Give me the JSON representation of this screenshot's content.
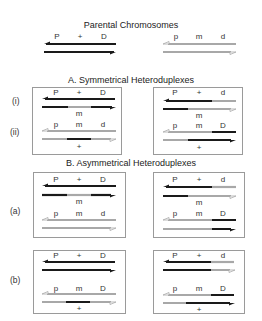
{
  "titles": {
    "parental": "Parental Chromosomes",
    "symmetrical": "A. Symmetrical Heteroduplexes",
    "asymmetrical": "B. Asymmetrical Heteroduplexes"
  },
  "row_labels": {
    "i": "(i)",
    "ii": "(ii)",
    "a": "(a)",
    "b": "(b)"
  },
  "colors": {
    "dark_strand": "#1a1a1a",
    "light_strand": "#a8a8a8",
    "box_border": "#9a9a9a"
  },
  "parental": {
    "left": {
      "markers": [
        "P",
        "+",
        "D"
      ],
      "strands": [
        "dark",
        "dark"
      ]
    },
    "right": {
      "markers": [
        "p",
        "m",
        "d"
      ],
      "strands": [
        "light",
        "light"
      ]
    }
  },
  "symmetrical": {
    "left": {
      "top_pair": {
        "markers_above": [
          "P",
          "+",
          "D"
        ],
        "marker_below": "m",
        "strand1": "dark",
        "strand2": "dark-light-dark"
      },
      "bottom_pair": {
        "markers_above": [
          "p",
          "m",
          "d"
        ],
        "marker_below": "+",
        "strand1": "light",
        "strand2": "light-dark-light"
      }
    },
    "right": {
      "top_pair": {
        "markers_above": [
          "P",
          "+",
          "d"
        ],
        "marker_below": "m",
        "strand1": "dark-light",
        "strand2": "dark-light"
      },
      "bottom_pair": {
        "markers_above": [
          "p",
          "m",
          "D"
        ],
        "marker_below": "+",
        "strand1": "light-dark",
        "strand2": "light-dark"
      }
    }
  },
  "asymmetrical": {
    "a_left": {
      "top_pair": {
        "markers_above": [
          "P",
          "+",
          "D"
        ],
        "marker_below": "m"
      },
      "bottom_pair": {
        "markers_above": [
          "p",
          "m",
          "d"
        ],
        "marker_below": ""
      }
    },
    "a_right": {
      "top_pair": {
        "markers_above": [
          "P",
          "+",
          "d"
        ],
        "marker_below": "m"
      },
      "bottom_pair": {
        "markers_above": [
          "p",
          "m",
          "D"
        ],
        "marker_below": ""
      }
    },
    "b_left": {
      "top_pair": {
        "markers_above": [
          "P",
          "+",
          "D"
        ],
        "marker_below": ""
      },
      "bottom_pair": {
        "markers_above": [
          "p",
          "m",
          "D"
        ],
        "marker_below": "+"
      }
    },
    "b_right": {
      "top_pair": {
        "markers_above": [
          "P",
          "+",
          "d"
        ],
        "marker_below": ""
      },
      "bottom_pair": {
        "markers_above": [
          "p",
          "m",
          "D"
        ],
        "marker_below": "+"
      }
    }
  },
  "labels": {
    "P": "P",
    "p": "p",
    "plus": "+",
    "m": "m",
    "D": "D",
    "d": "d"
  }
}
